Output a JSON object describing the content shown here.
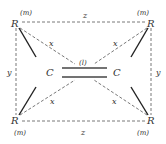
{
  "diagram": {
    "type": "molecular-geometry",
    "atoms": {
      "carbon_left": "C",
      "carbon_right": "C",
      "r_top_left": "R",
      "r_top_right": "R",
      "r_bottom_left": "R",
      "r_bottom_right": "R"
    },
    "labels": {
      "m_top_left": "(m)",
      "m_top_right": "(m)",
      "m_bottom_left": "(m)",
      "m_bottom_right": "(m)",
      "bond_l": "(l)",
      "z_top": "z",
      "z_bottom": "z",
      "y_left": "y",
      "y_right": "y",
      "x_top_left": "x",
      "x_top_right": "x",
      "x_bottom_left": "x",
      "x_bottom_right": "x"
    },
    "colors": {
      "line": "#333333",
      "background": "#ffffff"
    }
  }
}
